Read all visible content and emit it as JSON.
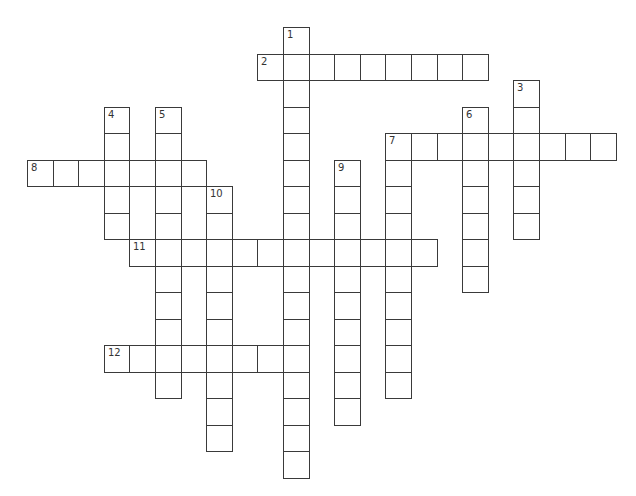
{
  "puzzle": {
    "grid_origin": {
      "x": 27,
      "y": 27
    },
    "cell_width": 25.6,
    "cell_height": 26.5,
    "border_color": "#3a3a3a",
    "words": [
      {
        "number": "1",
        "direction": "down",
        "row": 0,
        "col": 10,
        "length": 17
      },
      {
        "number": "2",
        "direction": "across",
        "row": 1,
        "col": 9,
        "length": 9
      },
      {
        "number": "3",
        "direction": "down",
        "row": 2,
        "col": 19,
        "length": 6
      },
      {
        "number": "4",
        "direction": "down",
        "row": 3,
        "col": 3,
        "length": 5
      },
      {
        "number": "5",
        "direction": "down",
        "row": 3,
        "col": 5,
        "length": 11
      },
      {
        "number": "6",
        "direction": "down",
        "row": 3,
        "col": 17,
        "length": 7
      },
      {
        "number": "7",
        "direction": "across",
        "row": 4,
        "col": 14,
        "length": 9
      },
      {
        "number": "7",
        "direction": "down",
        "row": 4,
        "col": 14,
        "length": 10
      },
      {
        "number": "8",
        "direction": "across",
        "row": 5,
        "col": 0,
        "length": 7
      },
      {
        "number": "9",
        "direction": "down",
        "row": 5,
        "col": 12,
        "length": 10
      },
      {
        "number": "10",
        "direction": "down",
        "row": 6,
        "col": 7,
        "length": 10
      },
      {
        "number": "11",
        "direction": "across",
        "row": 8,
        "col": 4,
        "length": 12
      },
      {
        "number": "12",
        "direction": "across",
        "row": 12,
        "col": 3,
        "length": 8
      }
    ]
  }
}
